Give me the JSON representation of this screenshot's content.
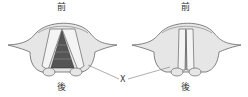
{
  "diagram": {
    "left": {
      "top_label": "前",
      "bottom_label": "後",
      "state": "open"
    },
    "right": {
      "top_label": "前",
      "bottom_label": "後",
      "state": "closed"
    },
    "pointer_label": "X",
    "colors": {
      "outline": "#666666",
      "fill": "#e6e6e6",
      "fold": "#f4f4f4",
      "glottis": "#555555",
      "line": "#777777"
    }
  }
}
